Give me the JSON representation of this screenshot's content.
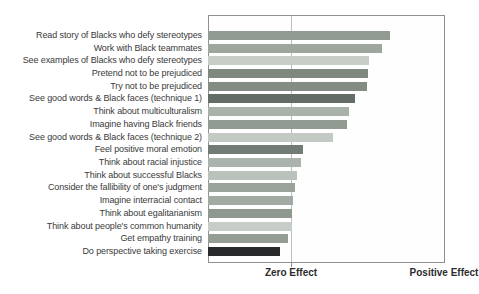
{
  "chart_data": {
    "type": "bar",
    "orientation": "horizontal",
    "title": "",
    "x_axis": {
      "zero_label": "Zero Effect",
      "positive_label": "Positive Effect",
      "zero_line_pct": 34.9,
      "numeric_ticks": "none"
    },
    "layout": {
      "grid": "single vertical zero-effect line",
      "bars_start": "left plot edge",
      "plot_border": true
    },
    "bars": [
      {
        "label": "Read story of Blacks who defy stereotypes",
        "length_pct": 77.1,
        "color": "#909a91"
      },
      {
        "label": "Work with Black teammates",
        "length_pct": 73.7,
        "color": "#9da79e"
      },
      {
        "label": "See examples of Blacks who defy stereotypes",
        "length_pct": 68.2,
        "color": "#c7cec8"
      },
      {
        "label": "Pretend not to be prejudiced",
        "length_pct": 67.8,
        "color": "#7e887f"
      },
      {
        "label": "Try not to be prejudiced",
        "length_pct": 67.4,
        "color": "#828c83"
      },
      {
        "label": "See good words & Black faces (technique 1)",
        "length_pct": 62.3,
        "color": "#636d65"
      },
      {
        "label": "Think about multiculturalism",
        "length_pct": 59.7,
        "color": "#a9b2aa"
      },
      {
        "label": "Imagine having Black friends",
        "length_pct": 58.9,
        "color": "#919b92"
      },
      {
        "label": "See good words & Black faces (technique 2)",
        "length_pct": 53.0,
        "color": "#c3cac4"
      },
      {
        "label": "Feel positive moral emotion",
        "length_pct": 40.3,
        "color": "#727c74"
      },
      {
        "label": "Think about racial injustice",
        "length_pct": 39.4,
        "color": "#abb4ac"
      },
      {
        "label": "Think about successful Blacks",
        "length_pct": 37.7,
        "color": "#bac2bb"
      },
      {
        "label": "Consider the fallibility of one's judgment",
        "length_pct": 36.9,
        "color": "#99a39a"
      },
      {
        "label": "Imagine interracial contact",
        "length_pct": 36.0,
        "color": "#a2aba3"
      },
      {
        "label": "Think about egalitarianism",
        "length_pct": 35.8,
        "color": "#8e988f"
      },
      {
        "label": "Think about people's common humanity",
        "length_pct": 35.6,
        "color": "#c6cdc7"
      },
      {
        "label": "Get empathy training",
        "length_pct": 33.9,
        "color": "#939d94"
      },
      {
        "label": "Do perspective taking exercise",
        "length_pct": 30.5,
        "color": "#27292a"
      }
    ]
  }
}
